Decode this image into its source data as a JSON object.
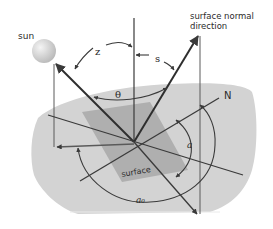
{
  "labels": {
    "sun": "sun",
    "normal_line1": "surface normal",
    "normal_line2": "direction",
    "zenith": "z",
    "slope": "s",
    "theta": "θ",
    "north": "N",
    "alpha": "a",
    "alpha0": "a₀",
    "surface": "surface"
  },
  "colors": {
    "background": "#ffffff",
    "ground": "#d2d2d2",
    "surface_patch": "#a9a9a9",
    "lines": "#3a3a3a",
    "sun_light": "#eeeeee",
    "sun_dark": "#b8b8b8"
  }
}
